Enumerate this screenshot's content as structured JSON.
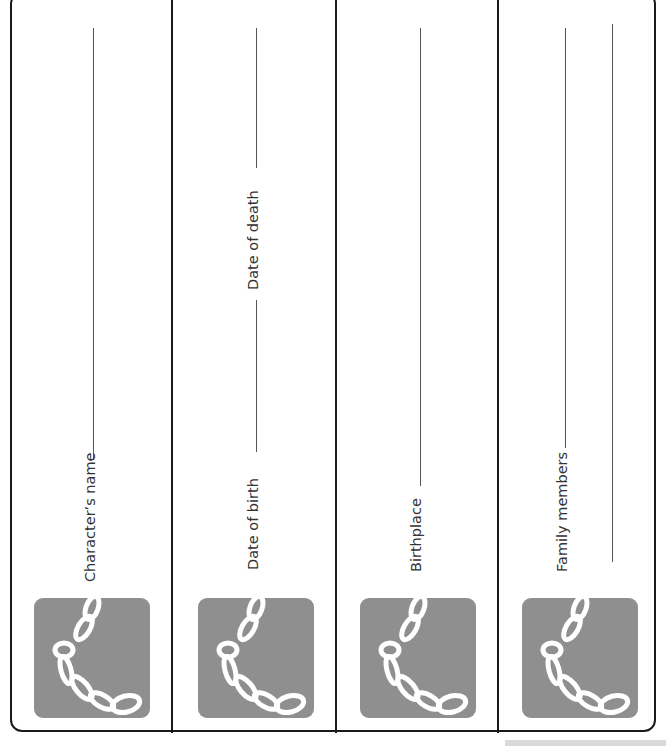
{
  "worksheet": {
    "columns": [
      {
        "id": "character",
        "labels": [
          "Character’s name"
        ],
        "icon": "chain-icon"
      },
      {
        "id": "dates",
        "labels": [
          "Date of birth",
          "Date of death"
        ],
        "icon": "chain-icon"
      },
      {
        "id": "birthplace",
        "labels": [
          "Birthplace"
        ],
        "icon": "chain-icon"
      },
      {
        "id": "family",
        "labels": [
          "Family members"
        ],
        "icon": "chain-icon"
      }
    ],
    "colors": {
      "border": "#1a1a1a",
      "icon_bg": "#8f8f8f",
      "icon_fg": "#ffffff",
      "text": "#333333"
    }
  }
}
